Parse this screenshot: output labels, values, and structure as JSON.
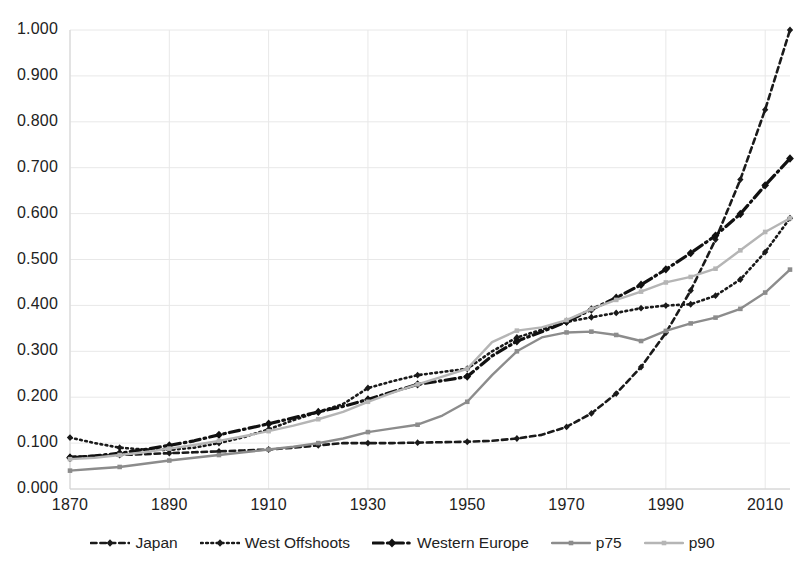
{
  "chart_data": {
    "type": "line",
    "title": "",
    "subtitle": "",
    "xlabel": "",
    "ylabel": "",
    "xlim": [
      1870,
      2015
    ],
    "ylim": [
      0.0,
      1.0
    ],
    "grid": true,
    "legend_position": "bottom",
    "xticks": [
      "1870",
      "1890",
      "1910",
      "1930",
      "1950",
      "1970",
      "1990",
      "2010"
    ],
    "xtick_values": [
      1870,
      1890,
      1910,
      1930,
      1950,
      1970,
      1990,
      2010
    ],
    "yticks": [
      "0.000",
      "0.100",
      "0.200",
      "0.300",
      "0.400",
      "0.500",
      "0.600",
      "0.700",
      "0.800",
      "0.900",
      "1.000"
    ],
    "ytick_values": [
      0.0,
      0.1,
      0.2,
      0.3,
      0.4,
      0.5,
      0.6,
      0.7,
      0.8,
      0.9,
      1.0
    ],
    "x": [
      1870,
      1875,
      1880,
      1885,
      1890,
      1895,
      1900,
      1905,
      1910,
      1915,
      1920,
      1925,
      1930,
      1935,
      1940,
      1945,
      1950,
      1955,
      1960,
      1965,
      1970,
      1975,
      1980,
      1985,
      1990,
      1995,
      2000,
      2005,
      2010,
      2015
    ],
    "series": [
      {
        "name": "Japan",
        "style": "dashed",
        "color": "#1a1a1a",
        "marker": "diamond",
        "width": 2.6,
        "values": [
          0.07,
          0.072,
          0.074,
          0.076,
          0.078,
          0.08,
          0.082,
          0.084,
          0.086,
          0.09,
          0.095,
          0.1,
          0.1,
          0.1,
          0.101,
          0.102,
          0.103,
          0.105,
          0.11,
          0.115,
          0.12,
          0.125,
          0.13,
          0.134,
          0.138,
          0.142,
          0.146,
          0.15,
          0.155,
          0.16
        ]
      },
      {
        "name": "West Offshoots",
        "style": "dotted",
        "color": "#1a1a1a",
        "marker": "diamond",
        "width": 2.6,
        "values": [
          0.112,
          0.1,
          0.09,
          0.086,
          0.085,
          0.09,
          0.1,
          0.113,
          0.13,
          0.15,
          0.168,
          0.185,
          0.22,
          0.235,
          0.248,
          0.255,
          0.262,
          0.3,
          0.33,
          0.348,
          0.368,
          0.385,
          0.405,
          0.43,
          0.455,
          0.482,
          0.53,
          0.6,
          0.7,
          0.82
        ]
      },
      {
        "name": "Western Europe",
        "style": "dashdot",
        "color": "#111111",
        "marker": "diamond",
        "width": 3.2,
        "values": [
          0.068,
          0.072,
          0.078,
          0.086,
          0.095,
          0.105,
          0.118,
          0.13,
          0.142,
          0.155,
          0.168,
          0.18,
          0.195,
          0.212,
          0.228,
          0.236,
          0.245,
          0.29,
          0.322,
          0.342,
          0.362,
          0.385,
          0.405,
          0.425,
          0.448,
          0.47,
          0.492,
          0.52,
          0.56,
          0.593
        ]
      },
      {
        "name": "p75",
        "style": "solid",
        "color": "#8c8c8c",
        "marker": "square",
        "width": 2.4,
        "values": [
          0.04,
          0.044,
          0.048,
          0.055,
          0.062,
          0.068,
          0.074,
          0.08,
          0.086,
          0.092,
          0.1,
          0.11,
          0.124,
          0.132,
          0.14,
          0.16,
          0.19,
          0.248,
          0.3,
          0.33,
          0.34,
          0.34,
          0.33,
          0.313,
          0.33,
          0.34,
          0.345,
          0.355,
          0.38,
          0.418
        ]
      },
      {
        "name": "p90",
        "style": "solid",
        "color": "#b5b5b5",
        "marker": "square",
        "width": 2.4,
        "values": [
          0.065,
          0.068,
          0.074,
          0.08,
          0.088,
          0.096,
          0.105,
          0.115,
          0.126,
          0.138,
          0.152,
          0.168,
          0.19,
          0.21,
          0.228,
          0.245,
          0.262,
          0.32,
          0.345,
          0.352,
          0.368,
          0.392,
          0.412,
          0.43,
          0.45,
          0.462,
          0.48,
          0.52,
          0.56,
          0.59
        ]
      }
    ],
    "series_endpoints": {
      "Japan": 1.0,
      "West Offshoots": 0.59,
      "Western Europe": 0.72,
      "p75": 0.478,
      "p90": 0.59
    }
  },
  "legend": {
    "items": [
      {
        "label": "Japan",
        "icon": "dashed-line-marker-icon"
      },
      {
        "label": "West Offshoots",
        "icon": "dotted-line-marker-icon"
      },
      {
        "label": "Western Europe",
        "icon": "dashdot-line-marker-icon"
      },
      {
        "label": "p75",
        "icon": "solid-gray-line-marker-icon"
      },
      {
        "label": "p90",
        "icon": "solid-lightgray-line-marker-icon"
      }
    ]
  },
  "colors": {
    "background": "#ffffff",
    "grid": "#e8e8e8",
    "axis_text": "#222222",
    "japan": "#1a1a1a",
    "west_offshoots": "#1a1a1a",
    "western_europe": "#111111",
    "p75": "#8c8c8c",
    "p90": "#b5b5b5"
  }
}
